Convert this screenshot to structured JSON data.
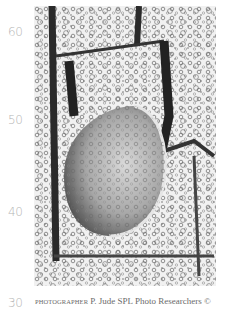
{
  "ruler": {
    "labels": [
      "60",
      "50",
      "40",
      "30"
    ]
  },
  "photo": {
    "subject": "lemon slice submerged in carbonated water with bubbles and ice",
    "icon": "photo-image"
  },
  "credit": {
    "prefix": "PHOTOGRAPHER",
    "text": "P. Jude SPL Photo Researchers ©"
  }
}
